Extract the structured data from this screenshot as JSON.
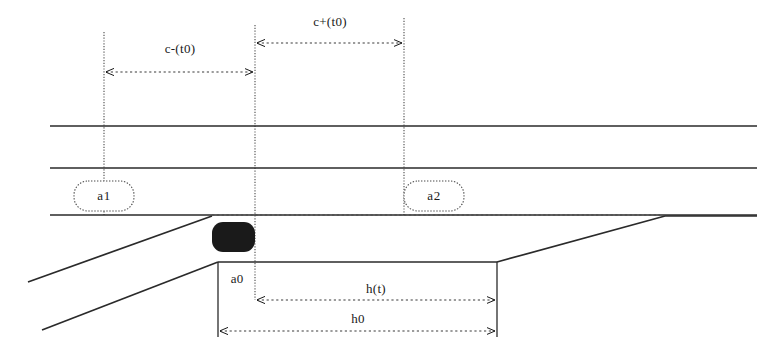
{
  "diagram": {
    "background_color": "#ffffff",
    "ink_color": "#1a1a1a",
    "width": 784,
    "height": 357,
    "labels": {
      "c_minus": "c-(t0)",
      "c_plus": "c+(t0)",
      "node_1": "a1",
      "node_2": "a2",
      "a0": "a0",
      "h_of_t": "h(t)",
      "h0": "h0"
    },
    "nodes": [
      {
        "id": "node-a1",
        "label": "a1",
        "cx": 104,
        "cy": 196,
        "rx": 30,
        "ry": 15
      },
      {
        "id": "node-a2",
        "label": "a2",
        "cx": 434,
        "cy": 196,
        "rx": 30,
        "ry": 15
      }
    ],
    "dimensions": [
      {
        "id": "c-minus",
        "label": "c-(t0)",
        "x1": 104,
        "x2": 255,
        "y": 72,
        "label_x": 180,
        "label_y": 53
      },
      {
        "id": "c-plus",
        "label": "c+(t0)",
        "x1": 255,
        "x2": 404,
        "y": 43,
        "label_x": 330,
        "label_y": 26
      },
      {
        "id": "h-of-t",
        "label": "h(t)",
        "x1": 255,
        "x2": 497,
        "y": 300,
        "label_x": 376,
        "label_y": 292
      },
      {
        "id": "h0",
        "label": "h0",
        "x1": 218,
        "x2": 497,
        "y": 331,
        "label_x": 358,
        "label_y": 322
      }
    ],
    "vertical_guides": [
      {
        "id": "guide-left",
        "x": 104,
        "y1": 32,
        "y2": 215
      },
      {
        "id": "guide-mid",
        "x": 255,
        "y1": 25,
        "y2": 300
      },
      {
        "id": "guide-right",
        "x": 404,
        "y1": 18,
        "y2": 215
      }
    ],
    "horizontal_tracks": [
      {
        "id": "track-upper",
        "y": 126,
        "x1": 50,
        "x2": 757
      },
      {
        "id": "track-middle",
        "y": 168,
        "x1": 50,
        "x2": 757
      },
      {
        "id": "track-lower",
        "y": 215,
        "x1": 50,
        "x2": 757
      }
    ],
    "object_marker": {
      "id": "moving-object",
      "x": 212,
      "y": 222,
      "width": 43,
      "height": 30,
      "fill": "#1a1a1a"
    }
  }
}
